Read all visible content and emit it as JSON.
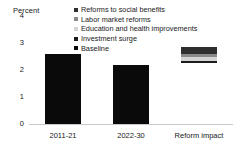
{
  "chart_data": {
    "type": "bar",
    "title": "",
    "subtitle": "",
    "ylabel": "Percent",
    "xlabel": "",
    "ylim": [
      0,
      4
    ],
    "yticks": [
      "0",
      "1",
      "2",
      "3",
      "4"
    ],
    "grid": false,
    "legend_position": "top-right",
    "categories": [
      "2011-21",
      "2022-30",
      "Reform impact"
    ],
    "series": [
      {
        "name": "Baseline",
        "color": "#0a0a0a",
        "values": [
          2.6,
          2.2,
          2.25
        ]
      },
      {
        "name": "Investment surge",
        "color": "#1c1c1c",
        "values": [
          0,
          0,
          0.1
        ]
      },
      {
        "name": "Education and health improvements",
        "color": "#d4d4d4",
        "values": [
          0,
          0,
          0.12
        ]
      },
      {
        "name": "Labor market reforms",
        "color": "#8a8a8a",
        "values": [
          0,
          0,
          0.13
        ]
      },
      {
        "name": "Reforms to social benefits",
        "color": "#2e2e2e",
        "values": [
          0,
          0,
          0.25
        ]
      }
    ],
    "annotations": []
  },
  "axis": {
    "y_title": "Percent",
    "ticks": [
      {
        "label": "4",
        "value": 4
      },
      {
        "label": "3",
        "value": 3
      },
      {
        "label": "2",
        "value": 2
      },
      {
        "label": "1",
        "value": 1
      },
      {
        "label": "0",
        "value": 0
      }
    ],
    "x_labels": [
      "2011-21",
      "2022-30",
      "Reform impact"
    ]
  },
  "legend": {
    "items": [
      {
        "label": "Reforms to social benefits",
        "color": "#2e2e2e"
      },
      {
        "label": "Labor market reforms",
        "color": "#8a8a8a"
      },
      {
        "label": "Education and health improvements",
        "color": "#d4d4d4"
      },
      {
        "label": "Investment surge",
        "color": "#1c1c1c"
      },
      {
        "label": "Baseline",
        "color": "#0a0a0a"
      }
    ]
  },
  "colors": {
    "baseline_bar": "#0a0a0a",
    "axis_line": "#c9c9c9",
    "text": "#1a1a1a",
    "background": "#ffffff"
  }
}
